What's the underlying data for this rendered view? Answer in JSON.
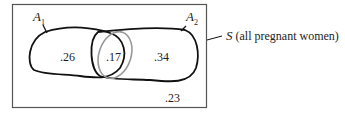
{
  "diagram": {
    "type": "venn",
    "universe": {
      "symbol": "S",
      "description": "(all pregnant women)"
    },
    "sets": [
      {
        "name": "A",
        "subscript": "1",
        "only_value": ".26"
      },
      {
        "name": "A",
        "subscript": "2",
        "only_value": ".34"
      }
    ],
    "intersection_value": ".17",
    "outside_value": ".23"
  }
}
